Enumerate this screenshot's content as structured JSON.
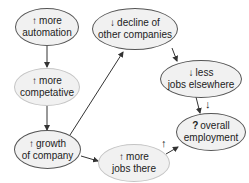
{
  "diagram": {
    "type": "causal-loop",
    "nodes": [
      {
        "id": "automation",
        "symbol": "↑",
        "line1": "more",
        "line2": "automation",
        "direction": "increase"
      },
      {
        "id": "competative",
        "symbol": "↑",
        "line1": "more",
        "line2": "competative",
        "direction": "increase"
      },
      {
        "id": "growth",
        "symbol": "↑",
        "line1": "growth",
        "line2": "of company",
        "direction": "increase"
      },
      {
        "id": "decline",
        "symbol": "↓",
        "line1": "decline of",
        "line2": "other companies",
        "direction": "decrease"
      },
      {
        "id": "less_jobs",
        "symbol": "↓",
        "line1": "less",
        "line2": "jobs elsewhere",
        "direction": "decrease"
      },
      {
        "id": "more_jobs",
        "symbol": "↑",
        "line1": "more",
        "line2": "jobs there",
        "direction": "increase"
      },
      {
        "id": "overall",
        "symbol": "?",
        "line1": "overall",
        "line2": "employment",
        "direction": "unknown"
      }
    ],
    "edges": [
      {
        "from": "automation",
        "to": "competative"
      },
      {
        "from": "competative",
        "to": "growth"
      },
      {
        "from": "growth",
        "to": "decline"
      },
      {
        "from": "decline",
        "to": "less_jobs"
      },
      {
        "from": "growth",
        "to": "more_jobs"
      },
      {
        "from": "less_jobs",
        "to": "overall",
        "label": "↓"
      },
      {
        "from": "more_jobs",
        "to": "overall",
        "label": "↑"
      }
    ],
    "edge_labels": {
      "less_jobs_to_overall": "↓",
      "more_jobs_to_overall": "↑"
    },
    "colors": {
      "node_fill": "#f1f1f1",
      "node_border_dark": "#555555",
      "node_border_light": "#c4c4c4",
      "edge": "#333333",
      "text": "#222222"
    }
  }
}
